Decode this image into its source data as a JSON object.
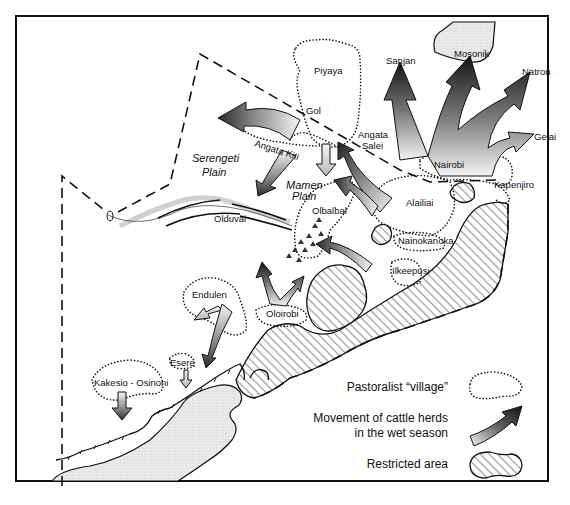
{
  "figure": {
    "type": "map",
    "colors": {
      "ink": "#111111",
      "background": "#ffffff",
      "hatch": "#9a9a9a",
      "arrow_dark": "#1a1a1a",
      "arrow_light": "#e8e8e8"
    }
  },
  "regions": {
    "serengeti_plain": [
      "Serengeti",
      "Plain"
    ],
    "mamen_plain": [
      "Mamen",
      "Plain"
    ],
    "olduvai": "Olduvai"
  },
  "villages": {
    "piyaya": "Piyaya",
    "gol": "Gol",
    "angata_salei": [
      "Angata",
      "Salei"
    ],
    "angata_kiti": "Angata  Kiti",
    "nairobi": "Nairobi",
    "kapenjiro": "Kapenjiro",
    "alailiai": "Alailiai",
    "nainokanoka": "Nainokanoka",
    "ilkeepusi": "Ilkeepusi",
    "olbalbal": "Olbalbal",
    "oloirobi": "Oloirobi",
    "endulen": "Endulen",
    "esere": "Esere",
    "kakesio_osinoni": "Kakesio - Osinoni"
  },
  "destinations": {
    "sanjan": "Sanjan",
    "mosonik": "Mosonik",
    "natron": "Natron",
    "gelai": "Gelai"
  },
  "legend": {
    "village": "Pastoralist “village”",
    "movement_line1": "Movement of cattle herds",
    "movement_line2": "in the wet season",
    "restricted": "Restricted area"
  }
}
